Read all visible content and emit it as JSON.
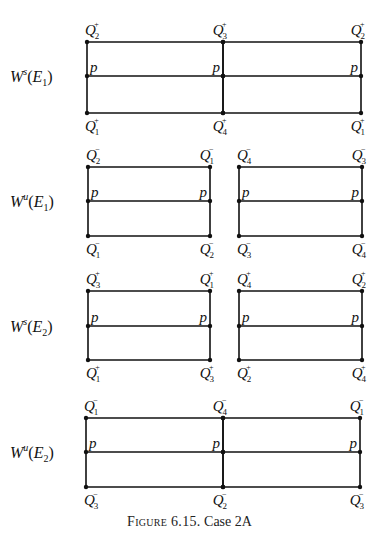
{
  "figure": {
    "caption_prefix": "Figure 6.15.",
    "caption_text": "Case 2A"
  },
  "panels": [
    {
      "id": "Ws_E1",
      "row_label": {
        "W": "W",
        "sup": "s",
        "E": "E",
        "sub": "1"
      },
      "boxes": [
        {
          "x1": 87,
          "x2": 223,
          "top": 42,
          "mid": 76,
          "bottom": 113,
          "top_left": {
            "sub": "2",
            "sup": "+"
          },
          "top_right": {
            "sub": "3",
            "sup": "+"
          },
          "bottom_left": {
            "sub": "1",
            "sup": "+"
          },
          "bottom_right": {
            "sub": "4",
            "sup": "+"
          },
          "p_left": "p",
          "p_right": "p"
        },
        {
          "x1": 223,
          "x2": 361,
          "top": 42,
          "mid": 76,
          "bottom": 113,
          "top_left": null,
          "top_right": {
            "sub": "2",
            "sup": "+"
          },
          "bottom_left": null,
          "bottom_right": {
            "sub": "1",
            "sup": "+"
          },
          "p_left": null,
          "p_right": "p"
        }
      ]
    },
    {
      "id": "Wu_E1",
      "row_label": {
        "W": "W",
        "sup": "u",
        "E": "E",
        "sub": "1"
      },
      "boxes": [
        {
          "x1": 88,
          "x2": 210,
          "top": 167,
          "mid": 201,
          "bottom": 236,
          "top_left": {
            "sub": "2",
            "sup": "−"
          },
          "top_right": {
            "sub": "1",
            "sup": "−"
          },
          "bottom_left": {
            "sub": "1",
            "sup": "−"
          },
          "bottom_right": {
            "sub": "2",
            "sup": "−"
          },
          "p_left": "p",
          "p_right": "p"
        },
        {
          "x1": 239,
          "x2": 362,
          "top": 167,
          "mid": 201,
          "bottom": 236,
          "top_left": {
            "sub": "4",
            "sup": "−"
          },
          "top_right": {
            "sub": "3",
            "sup": "−"
          },
          "bottom_left": {
            "sub": "3",
            "sup": "−"
          },
          "bottom_right": {
            "sub": "4",
            "sup": "−"
          },
          "p_left": "p",
          "p_right": "p"
        }
      ]
    },
    {
      "id": "Ws_E2",
      "row_label": {
        "W": "W",
        "sup": "s",
        "E": "E",
        "sub": "2"
      },
      "boxes": [
        {
          "x1": 88,
          "x2": 210,
          "top": 291,
          "mid": 326,
          "bottom": 360,
          "top_left": {
            "sub": "3",
            "sup": "+"
          },
          "top_right": {
            "sub": "1",
            "sup": "+"
          },
          "bottom_left": {
            "sub": "1",
            "sup": "+"
          },
          "bottom_right": {
            "sub": "3",
            "sup": "+"
          },
          "p_left": "p",
          "p_right": "p"
        },
        {
          "x1": 239,
          "x2": 362,
          "top": 291,
          "mid": 326,
          "bottom": 360,
          "top_left": {
            "sub": "4",
            "sup": "+"
          },
          "top_right": {
            "sub": "2",
            "sup": "+"
          },
          "bottom_left": {
            "sub": "2",
            "sup": "+"
          },
          "bottom_right": {
            "sub": "4",
            "sup": "+"
          },
          "p_left": "p",
          "p_right": "p"
        }
      ]
    },
    {
      "id": "Wu_E2",
      "row_label": {
        "W": "W",
        "sup": "u",
        "E": "E",
        "sub": "2"
      },
      "boxes": [
        {
          "x1": 86,
          "x2": 223,
          "top": 418,
          "mid": 452,
          "bottom": 487,
          "top_left": {
            "sub": "1",
            "sup": "−"
          },
          "top_right": {
            "sub": "4",
            "sup": "−"
          },
          "bottom_left": {
            "sub": "3",
            "sup": "−"
          },
          "bottom_right": {
            "sub": "2",
            "sup": "−"
          },
          "p_left": "p",
          "p_right": "p"
        },
        {
          "x1": 223,
          "x2": 360,
          "top": 418,
          "mid": 452,
          "bottom": 487,
          "top_left": null,
          "top_right": {
            "sub": "1",
            "sup": "−"
          },
          "bottom_left": null,
          "bottom_right": {
            "sub": "3",
            "sup": "−"
          },
          "p_left": null,
          "p_right": "p"
        }
      ]
    }
  ],
  "q_symbol": "Q"
}
